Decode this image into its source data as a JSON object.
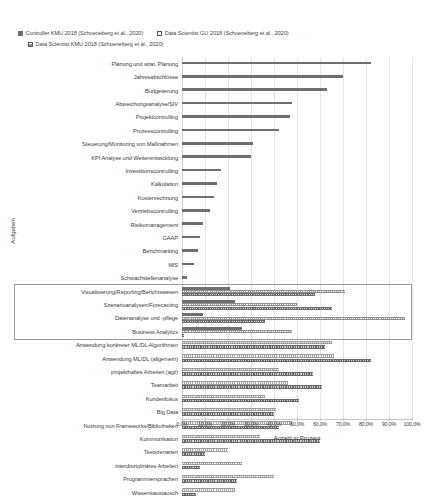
{
  "chart_data": {
    "type": "bar",
    "orientation": "horizontal",
    "title": "",
    "xlabel": "Anzahl in Prozent",
    "ylabel": "Aufgaben",
    "xlim": [
      0,
      100
    ],
    "xtick_labels": [
      "0,0%",
      "10,0%",
      "20,0%",
      "30,0%",
      "40,0%",
      "50,0%",
      "60,0%",
      "70,0%",
      "80,0%",
      "90,0%",
      "100,0%"
    ],
    "xtick_values": [
      0,
      10,
      20,
      30,
      40,
      50,
      60,
      70,
      80,
      90,
      100
    ],
    "grid": true,
    "legend_position": "top-left",
    "legend": [
      {
        "name": "Controller KMU 2018 (Schoeneberg et al., 2020)",
        "marker": "solid"
      },
      {
        "name": "Data Scientist GU 2018 (Schoeneberg et al., 2020)",
        "marker": "open"
      },
      {
        "name": "Data Scientist KMU 2018 (Schoeneberg et al., 2020)",
        "marker": "hatch"
      }
    ],
    "categories": [
      "Planung und strat. Planung",
      "Jahresabschlüsse",
      "Budgetierung",
      "Abweichungsanalyse/SIV",
      "Projektcontrolling",
      "Prozesscontrolling",
      "Steuerung/Monitoring von Maßnahmen",
      "KPI Analyse und Weiterentwicklung",
      "Investitionscontrolling",
      "Kalkulation",
      "Kostenrechnung",
      "Vertriebscontrolling",
      "Risikomanagement",
      "GAAP",
      "Benchmarking",
      "MIS",
      "Schwachstellenanalyse",
      "Visualisierung/Reporting/Berichtswesen",
      "Szenarioanalysen/Forecasting",
      "Datenanalyse und -pflege",
      "Business Analytics",
      "Anwendung konkreter ML/DL Algorithmen",
      "Anwendung ML/DL (allgemein)",
      "projekthaftes Arbeiten (agil)",
      "Teamarbeit",
      "Kundenfokus",
      "Big Data",
      "Nutzung von Frameworks/Bibliotheken",
      "Kommunikation",
      "Testszenarien",
      "interdisziplinäres Arbeiten",
      "Programmiersprachen",
      "Wissensaustausch"
    ],
    "series": [
      {
        "name": "Controller KMU 2018 (Schoeneberg et al., 2020)",
        "marker": "solid",
        "values": [
          82.0,
          70.0,
          63.0,
          48.0,
          47.0,
          42.0,
          31.0,
          30.0,
          17.0,
          15.0,
          14.0,
          12.0,
          9.0,
          8.0,
          7.0,
          5.0,
          2.0,
          21.0,
          23.0,
          9.0,
          26.0,
          null,
          null,
          null,
          null,
          null,
          null,
          null,
          null,
          null,
          null,
          null,
          null
        ]
      },
      {
        "name": "Data Scientist GU 2018 (Schoeneberg et al., 2020)",
        "marker": "open",
        "values": [
          null,
          null,
          null,
          null,
          null,
          null,
          null,
          null,
          null,
          null,
          null,
          null,
          null,
          null,
          null,
          null,
          null,
          71.0,
          50.0,
          97.0,
          48.0,
          65.0,
          66.0,
          42.0,
          46.0,
          36.0,
          41.0,
          48.0,
          34.0,
          20.0,
          26.0,
          40.0,
          23.0
        ]
      },
      {
        "name": "Data Scientist KMU 2018 (Schoeneberg et al., 2020)",
        "marker": "hatch",
        "values": [
          null,
          null,
          null,
          null,
          null,
          null,
          null,
          null,
          null,
          null,
          null,
          null,
          null,
          null,
          null,
          null,
          null,
          58.0,
          65.0,
          36.0,
          1.0,
          62.0,
          82.0,
          57.0,
          61.0,
          51.0,
          40.0,
          42.0,
          60.0,
          10.0,
          8.0,
          24.0,
          6.0
        ]
      }
    ],
    "grouped_box": {
      "from_category": "Visualisierung/Reporting/Berichtswesen",
      "to_category": "Business Analytics",
      "note": "bordered emphasis box"
    }
  }
}
